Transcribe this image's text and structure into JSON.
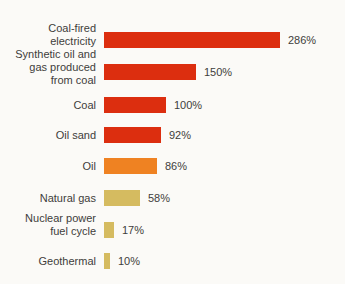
{
  "chart_data": {
    "type": "bar",
    "orientation": "horizontal",
    "title": "",
    "xlabel": "",
    "ylabel": "",
    "categories": [
      "Coal-fired electricity",
      "Synthetic oil and gas produced from coal",
      "Coal",
      "Oil sand",
      "Oil",
      "Natural gas",
      "Nuclear power fuel cycle",
      "Geothermal"
    ],
    "categories_wrapped": [
      "Coal-fired\nelectricity",
      "Synthetic oil and\ngas produced\nfrom coal",
      "Coal",
      "Oil sand",
      "Oil",
      "Natural gas",
      "Nuclear power\nfuel cycle",
      "Geothermal"
    ],
    "values": [
      286,
      150,
      100,
      92,
      86,
      58,
      17,
      10
    ],
    "value_labels": [
      "286%",
      "150%",
      "100%",
      "92%",
      "86%",
      "58%",
      "17%",
      "10%"
    ],
    "unit": "%",
    "bar_colors": [
      "#dc2e0f",
      "#dc2e0f",
      "#dc2e0f",
      "#dc2e0f",
      "#ef8222",
      "#d5bb60",
      "#d5bb60",
      "#d5bb60"
    ],
    "xlim": [
      0,
      300
    ],
    "grid": false,
    "legend": false,
    "value_labels_position": "right-of-bar"
  },
  "colors": {
    "red": "#dc2e0f",
    "orange": "#ef8222",
    "tan": "#d5bb60",
    "label_text": "#3e3d3b",
    "background": "#fbfaf7"
  }
}
